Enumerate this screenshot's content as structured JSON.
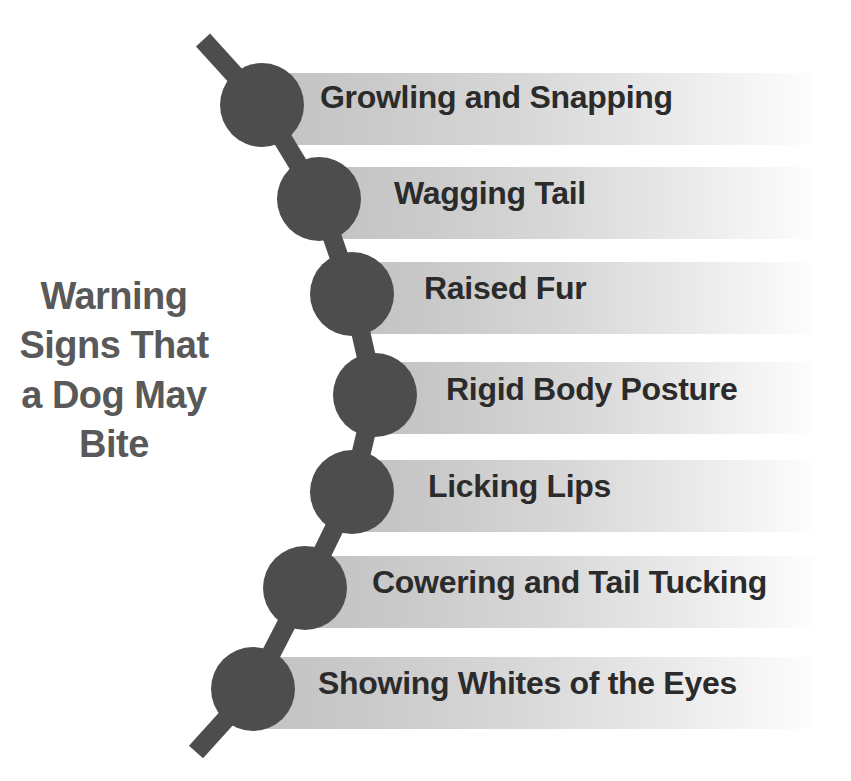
{
  "title": {
    "full_text": "Warning Signs That a Dog May Bite",
    "lines": [
      "Warning",
      "Signs That",
      "a Dog May",
      "Bite"
    ],
    "color": "#595959"
  },
  "theme": {
    "background": "#ffffff",
    "chain_color": "#4d4d4d",
    "bar_gradient_start": "#c2c2c2",
    "bar_gradient_end": "#fdfdfd",
    "label_color": "#2b2b2b"
  },
  "chart_data": {
    "type": "table",
    "title": "Warning Signs That a Dog May Bite",
    "xlabel": "",
    "ylabel": "",
    "categories": [
      "Growling and Snapping",
      "Wagging Tail",
      "Raised Fur",
      "Rigid Body Posture",
      "Licking Lips",
      "Cowering and Tail Tucking",
      "Showing Whites of the Eyes"
    ],
    "values": [
      1,
      2,
      3,
      4,
      5,
      6,
      7
    ],
    "series": [
      {
        "name": "Warning Signs",
        "values": [
          1,
          2,
          3,
          4,
          5,
          6,
          7
        ]
      }
    ],
    "legend_position": "none",
    "grid": false
  },
  "items": [
    {
      "index": 1,
      "label": "Growling and Snapping",
      "node_cx": 262,
      "node_cy": 105,
      "node_r": 42,
      "bar_x": 263,
      "bar_y": 73,
      "bar_w": 549,
      "bar_h": 72,
      "text_x": 320,
      "text_y": 81,
      "text_size": 32
    },
    {
      "index": 2,
      "label": "Wagging Tail",
      "node_cx": 319,
      "node_cy": 199,
      "node_r": 42,
      "bar_x": 320,
      "bar_y": 167,
      "bar_w": 493,
      "bar_h": 72,
      "text_x": 394,
      "text_y": 177,
      "text_size": 32
    },
    {
      "index": 3,
      "label": "Raised Fur",
      "node_cx": 352,
      "node_cy": 294,
      "node_r": 42,
      "bar_x": 353,
      "bar_y": 262,
      "bar_w": 459,
      "bar_h": 72,
      "text_x": 424,
      "text_y": 272,
      "text_size": 32
    },
    {
      "index": 4,
      "label": "Rigid Body Posture",
      "node_cx": 375,
      "node_cy": 395,
      "node_r": 42,
      "bar_x": 376,
      "bar_y": 362,
      "bar_w": 436,
      "bar_h": 72,
      "text_x": 446,
      "text_y": 373,
      "text_size": 32
    },
    {
      "index": 5,
      "label": "Licking Lips",
      "node_cx": 352,
      "node_cy": 492,
      "node_r": 42,
      "bar_x": 353,
      "bar_y": 460,
      "bar_w": 459,
      "bar_h": 72,
      "text_x": 428,
      "text_y": 470,
      "text_size": 32
    },
    {
      "index": 6,
      "label": "Cowering and Tail Tucking",
      "node_cx": 305,
      "node_cy": 588,
      "node_r": 42,
      "bar_x": 306,
      "bar_y": 556,
      "bar_w": 507,
      "bar_h": 72,
      "text_x": 372,
      "text_y": 566,
      "text_size": 32
    },
    {
      "index": 7,
      "label": "Showing Whites of the Eyes",
      "node_cx": 253,
      "node_cy": 689,
      "node_r": 42,
      "bar_x": 254,
      "bar_y": 657,
      "bar_w": 559,
      "bar_h": 72,
      "text_x": 318,
      "text_y": 667,
      "text_size": 32
    }
  ],
  "chain_segments": [
    {
      "x1": 203,
      "y1": 40,
      "x2": 262,
      "y2": 105
    },
    {
      "x1": 262,
      "y1": 105,
      "x2": 319,
      "y2": 199
    },
    {
      "x1": 319,
      "y1": 199,
      "x2": 352,
      "y2": 294
    },
    {
      "x1": 352,
      "y1": 294,
      "x2": 375,
      "y2": 395
    },
    {
      "x1": 375,
      "y1": 395,
      "x2": 352,
      "y2": 492
    },
    {
      "x1": 352,
      "y1": 492,
      "x2": 305,
      "y2": 588
    },
    {
      "x1": 305,
      "y1": 588,
      "x2": 253,
      "y2": 689
    },
    {
      "x1": 253,
      "y1": 689,
      "x2": 196,
      "y2": 752
    }
  ]
}
